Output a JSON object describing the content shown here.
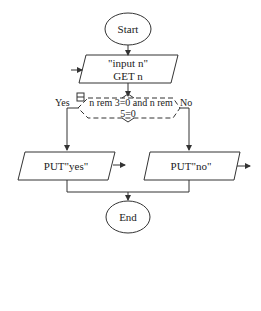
{
  "diagram": {
    "type": "flowchart",
    "stroke_color": "#333333",
    "background": "#ffffff",
    "nodes": {
      "start": {
        "shape": "terminator",
        "label": "Start"
      },
      "input": {
        "shape": "io",
        "line1": "\"input n\"",
        "line2": "GET n"
      },
      "decision": {
        "shape": "decision",
        "line1": "n rem 3=0 and n rem",
        "line2": "5=0",
        "yes_label": "Yes",
        "no_label": "No"
      },
      "put_yes": {
        "shape": "io",
        "label": "PUT\"yes\""
      },
      "put_no": {
        "shape": "io",
        "label": "PUT\"no\""
      },
      "end": {
        "shape": "terminator",
        "label": "End"
      }
    },
    "edges": [
      {
        "from": "start",
        "to": "input"
      },
      {
        "from": "input",
        "to": "decision"
      },
      {
        "from": "decision",
        "to": "put_yes",
        "label": "Yes"
      },
      {
        "from": "decision",
        "to": "put_no",
        "label": "No"
      },
      {
        "from": "put_yes",
        "to": "end"
      },
      {
        "from": "put_no",
        "to": "end"
      }
    ]
  }
}
